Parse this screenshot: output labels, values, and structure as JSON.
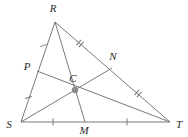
{
  "figure": {
    "type": "geometry-diagram",
    "width": 188,
    "height": 137,
    "background_color": "#ffffff",
    "stroke_color": "#7a7a7a",
    "label_color": "#2b2b2b",
    "centroid_fill": "#8a8a8a"
  },
  "points": {
    "R": {
      "label": "R",
      "x": 55,
      "y": 22,
      "label_x": 53,
      "label_y": 12
    },
    "S": {
      "label": "S",
      "x": 21,
      "y": 122,
      "label_x": 9,
      "label_y": 128
    },
    "T": {
      "label": "T",
      "x": 170,
      "y": 122,
      "label_x": 178,
      "label_y": 128
    },
    "P": {
      "label": "P",
      "x": 37,
      "y": 71,
      "label_x": 27,
      "label_y": 70
    },
    "N": {
      "label": "N",
      "x": 108,
      "y": 66,
      "label_x": 112,
      "label_y": 60
    },
    "M": {
      "label": "M",
      "x": 85,
      "y": 122,
      "label_x": 82,
      "label_y": 134
    },
    "C": {
      "label": "C",
      "x": 75,
      "y": 90,
      "label_x": 72,
      "label_y": 82
    }
  },
  "segments": [
    {
      "name": "side-RS",
      "from": "R",
      "to": "S"
    },
    {
      "name": "side-RT",
      "from": "R",
      "to": "T"
    },
    {
      "name": "side-ST",
      "from": "S",
      "to": "T"
    },
    {
      "name": "median-R-to-M",
      "from": "R",
      "to": "M"
    },
    {
      "name": "median-S-to-N",
      "from": "S",
      "to": "N"
    },
    {
      "name": "median-T-to-P",
      "from": "T",
      "to": "P"
    }
  ],
  "tick_marks": [
    {
      "name": "tick-RP",
      "segment": "R-P",
      "count": 1,
      "x": 43.5,
      "y": 45.5,
      "angle": 71
    },
    {
      "name": "tick-PS",
      "segment": "P-S",
      "count": 1,
      "x": 28.0,
      "y": 97.0,
      "angle": 73
    },
    {
      "name": "tick-RN",
      "segment": "R-N",
      "count": 2,
      "x": 80.0,
      "y": 43.0,
      "angle": 41
    },
    {
      "name": "tick-NT",
      "segment": "N-T",
      "count": 2,
      "x": 138.0,
      "y": 93.0,
      "angle": 41
    },
    {
      "name": "tick-SM",
      "segment": "S-M",
      "count": 1,
      "x": 53.0,
      "y": 122.0,
      "angle": 0
    },
    {
      "name": "tick-MT",
      "segment": "M-T",
      "count": 1,
      "x": 127.0,
      "y": 122.0,
      "angle": 0
    }
  ],
  "labels_order": [
    "R",
    "P",
    "N",
    "C",
    "S",
    "M",
    "T"
  ]
}
